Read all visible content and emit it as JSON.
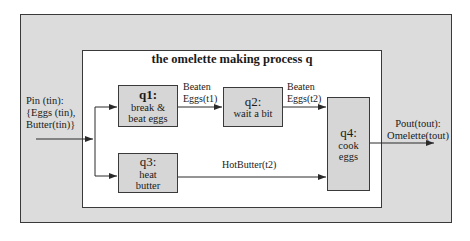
{
  "diagram": {
    "title": "the omelette making process q",
    "input": {
      "label": "Pin (tin):\n{Eggs (tin),\nButter(tin)}"
    },
    "output": {
      "label": "Pout(tout):\nOmelette(tout)"
    },
    "processes": [
      {
        "id": "q1:",
        "label": "break &\nbeat eggs"
      },
      {
        "id": "q2:",
        "label": "wait a bit"
      },
      {
        "id": "q3:",
        "label": "heat\nbutter"
      },
      {
        "id": "q4:",
        "label": "cook\neggs"
      }
    ],
    "edges": [
      {
        "from": "input",
        "to": "q1",
        "label": ""
      },
      {
        "from": "input",
        "to": "q3",
        "label": ""
      },
      {
        "from": "q1",
        "to": "q2",
        "label": "Beaten\nEggs(t1)"
      },
      {
        "from": "q2",
        "to": "q4",
        "label": "Beaten\nEggs(t2)"
      },
      {
        "from": "q3",
        "to": "q4",
        "label": "HotButter(t2)"
      },
      {
        "from": "q4",
        "to": "output",
        "label": ""
      }
    ],
    "colors": {
      "outer_fill": "#dcdcdc",
      "inner_fill": "#ffffff",
      "process_fill": "#d6d6d6",
      "stroke": "#3a3a3a"
    }
  }
}
